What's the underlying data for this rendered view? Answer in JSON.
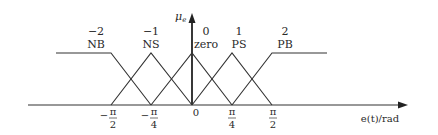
{
  "diagram": {
    "y_axis": {
      "label_main": "μ",
      "label_sub": "e"
    },
    "x_axis": {
      "label": "e(t)/rad"
    },
    "origin_label": "0",
    "ticks": [
      {
        "sign": "−",
        "num": "π",
        "den": "2",
        "x": 111
      },
      {
        "sign": "−",
        "num": "π",
        "den": "4",
        "x": 151
      },
      {
        "sign": "",
        "num": "π",
        "den": "4",
        "x": 232
      },
      {
        "sign": "",
        "num": "π",
        "den": "2",
        "x": 272
      }
    ],
    "sets": [
      {
        "index": "−2",
        "name": "NB",
        "x": 92
      },
      {
        "index": "−1",
        "name": "NS",
        "x": 151
      },
      {
        "index": "0",
        "name": "zero",
        "x": 206
      },
      {
        "index": "1",
        "name": "PS",
        "x": 239
      },
      {
        "index": "2",
        "name": "PB",
        "x": 285
      }
    ],
    "colors": {
      "line": "#333333",
      "axis": "#222222"
    }
  }
}
